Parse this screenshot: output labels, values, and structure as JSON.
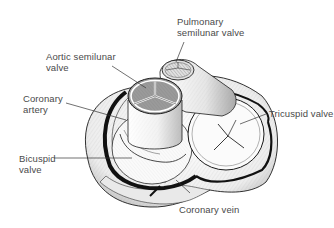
{
  "diagram": {
    "labels": {
      "pulmonary": "Pulmonary\nsemilunar valve",
      "aortic": "Aortic semilunar\nvalve",
      "coronary_artery": "Coronary\nartery",
      "tricuspid": "Tricuspid valve",
      "bicuspid": "Bicuspid\nvalve",
      "coronary_vein": "Coronary vein"
    },
    "colors": {
      "ink": "#1a1a1a",
      "shade": "#bdbdbd",
      "light": "#f2f2f2",
      "text": "#4a4a4a",
      "vessel": "#111111"
    }
  }
}
